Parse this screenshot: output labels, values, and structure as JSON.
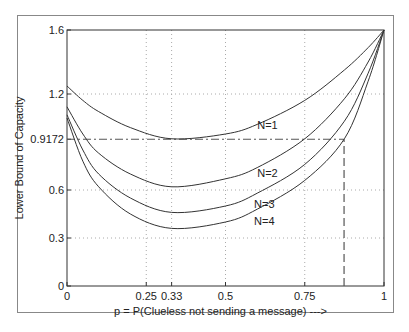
{
  "chart_data": {
    "type": "line",
    "title": "",
    "xlabel": "p = P(Clueless not sending a message) --->",
    "ylabel": "Lower Bound of Capacity",
    "xlim": [
      0,
      1
    ],
    "ylim": [
      0,
      1.6
    ],
    "grid": true,
    "xticks": [
      0,
      0.25,
      0.33,
      0.5,
      0.75,
      1
    ],
    "xtick_labels": [
      "0",
      "0.25",
      "0.33",
      "0.5",
      "0.75",
      "1"
    ],
    "yticks": [
      0,
      0.3,
      0.6,
      0.9172,
      1.2,
      1.6
    ],
    "ytick_labels": [
      "0",
      "0.3",
      "0.6",
      "0.9172",
      "1.2",
      "1.6"
    ],
    "x": [
      0,
      0.05,
      0.1,
      0.2,
      0.33,
      0.5,
      0.6,
      0.75,
      0.875,
      0.95,
      1
    ],
    "series": [
      {
        "name": "N=1",
        "values": [
          1.25,
          1.16,
          1.09,
          0.99,
          0.92,
          0.95,
          1.01,
          1.16,
          1.35,
          1.49,
          1.6
        ],
        "label_pos": [
          0.6,
          0.98
        ]
      },
      {
        "name": "N=2",
        "values": [
          1.12,
          0.95,
          0.83,
          0.7,
          0.62,
          0.67,
          0.74,
          0.92,
          1.17,
          1.4,
          1.6
        ],
        "label_pos": [
          0.6,
          0.68
        ]
      },
      {
        "name": "N=3",
        "values": [
          1.07,
          0.85,
          0.7,
          0.55,
          0.46,
          0.5,
          0.58,
          0.76,
          1.03,
          1.33,
          1.6
        ],
        "label_pos": [
          0.59,
          0.49
        ]
      },
      {
        "name": "N=4",
        "values": [
          1.05,
          0.78,
          0.62,
          0.45,
          0.36,
          0.4,
          0.48,
          0.66,
          0.92,
          1.28,
          1.6
        ],
        "label_pos": [
          0.59,
          0.38
        ]
      }
    ],
    "annotations": [
      {
        "type": "hline-dashdot",
        "y": 0.9172,
        "x_from": 0,
        "x_to": 0.874
      },
      {
        "type": "vline-dashed",
        "x": 0.874,
        "y_from": 0,
        "y_to": 0.9172
      }
    ]
  }
}
